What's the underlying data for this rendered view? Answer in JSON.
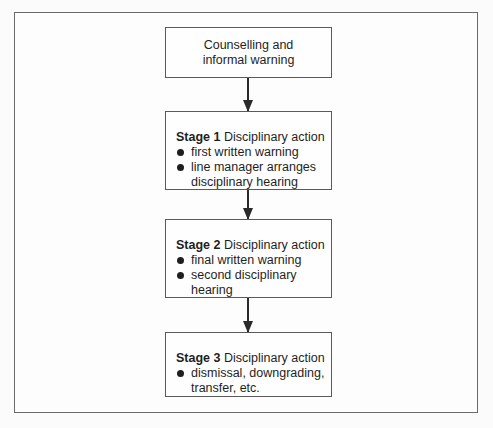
{
  "diagram": {
    "type": "flowchart",
    "direction": "top-to-bottom",
    "nodes": [
      {
        "id": "counselling",
        "lines": [
          "Counselling and",
          "informal warning"
        ]
      },
      {
        "id": "stage1",
        "stage_label": "Stage 1",
        "title": " Disciplinary action",
        "items": [
          "first written warning",
          "line manager arranges",
          "disciplinary hearing"
        ]
      },
      {
        "id": "stage2",
        "stage_label": "Stage 2",
        "title": " Disciplinary action",
        "items": [
          "final written warning",
          "second disciplinary",
          "hearing"
        ]
      },
      {
        "id": "stage3",
        "stage_label": "Stage 3",
        "title": " Disciplinary action",
        "items": [
          "dismissal, downgrading,",
          "transfer, etc."
        ]
      }
    ],
    "edges": [
      {
        "from": "counselling",
        "to": "stage1"
      },
      {
        "from": "stage1",
        "to": "stage2"
      },
      {
        "from": "stage2",
        "to": "stage3"
      }
    ]
  }
}
